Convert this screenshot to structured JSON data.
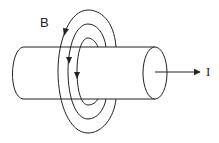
{
  "diagram": {
    "labels": {
      "field": "B",
      "current": "I"
    },
    "elements": {
      "conductor": "cylinder",
      "field_loops": 3,
      "field_direction": "counterclockwise arrows (downward on left side)",
      "current_direction": "right"
    },
    "colors": {
      "stroke": "#222222",
      "background": "#ffffff"
    }
  }
}
